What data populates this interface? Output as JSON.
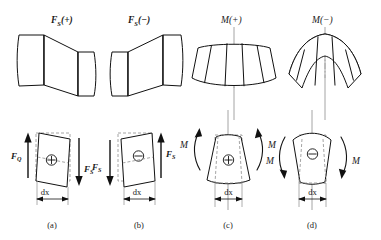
{
  "figure": {
    "background_color": "#ffffff",
    "line_color": "#111111",
    "dashed_color": "#8d8d8d",
    "axis_color": "#9a9a9a"
  },
  "top_row": [
    {
      "id": "fs-positive",
      "label_main": "F",
      "label_sub": "S",
      "label_suffix": "(+)",
      "label_full": "FS(+)",
      "description": "positive shear deformation: left face displaced up, right face displaced down"
    },
    {
      "id": "fs-negative",
      "label_main": "F",
      "label_sub": "S",
      "label_suffix": "(−)",
      "label_full": "FS(−)",
      "description": "negative shear deformation: left face displaced down, right face displaced up"
    },
    {
      "id": "m-positive",
      "label_main": "M",
      "label_sub": "",
      "label_suffix": "(+)",
      "label_full": "M(+)",
      "description": "positive bending: sagging curvature, concave upward"
    },
    {
      "id": "m-negative",
      "label_main": "M",
      "label_sub": "",
      "label_suffix": "(−)",
      "label_full": "M(−)",
      "description": "negative bending: hogging curvature, concave downward"
    }
  ],
  "bottom_row": [
    {
      "id": "panel-a",
      "caption": "(a)",
      "sign_symbol": "⊕",
      "sign_name": "circled-plus",
      "dimension_label": "dx",
      "forces": [
        {
          "name": "left-shear-force",
          "main": "F",
          "sub": "Q",
          "direction": "up",
          "side": "left"
        },
        {
          "name": "right-shear-force",
          "main": "F",
          "sub": "S",
          "direction": "down",
          "side": "right"
        }
      ]
    },
    {
      "id": "panel-b",
      "caption": "(b)",
      "sign_symbol": "⊖",
      "sign_name": "circled-minus",
      "dimension_label": "dx",
      "forces": [
        {
          "name": "left-shear-force",
          "main": "F",
          "sub": "S",
          "direction": "down",
          "side": "left"
        },
        {
          "name": "right-shear-force",
          "main": "F",
          "sub": "S",
          "direction": "up",
          "side": "right"
        }
      ]
    },
    {
      "id": "panel-c",
      "caption": "(c)",
      "sign_symbol": "⊕",
      "sign_name": "circled-plus",
      "dimension_label": "dx",
      "moments": [
        {
          "name": "left-moment",
          "label": "M",
          "side": "left",
          "sense": "counterclockwise-up"
        },
        {
          "name": "right-moment",
          "label": "M",
          "side": "right",
          "sense": "clockwise-up"
        }
      ]
    },
    {
      "id": "panel-d",
      "caption": "(d)",
      "sign_symbol": "⊖",
      "sign_name": "circled-minus",
      "dimension_label": "dx",
      "moments": [
        {
          "name": "left-moment",
          "label": "M",
          "side": "left",
          "sense": "clockwise-down"
        },
        {
          "name": "right-moment",
          "label": "M",
          "side": "right",
          "sense": "counterclockwise-down"
        }
      ]
    }
  ]
}
